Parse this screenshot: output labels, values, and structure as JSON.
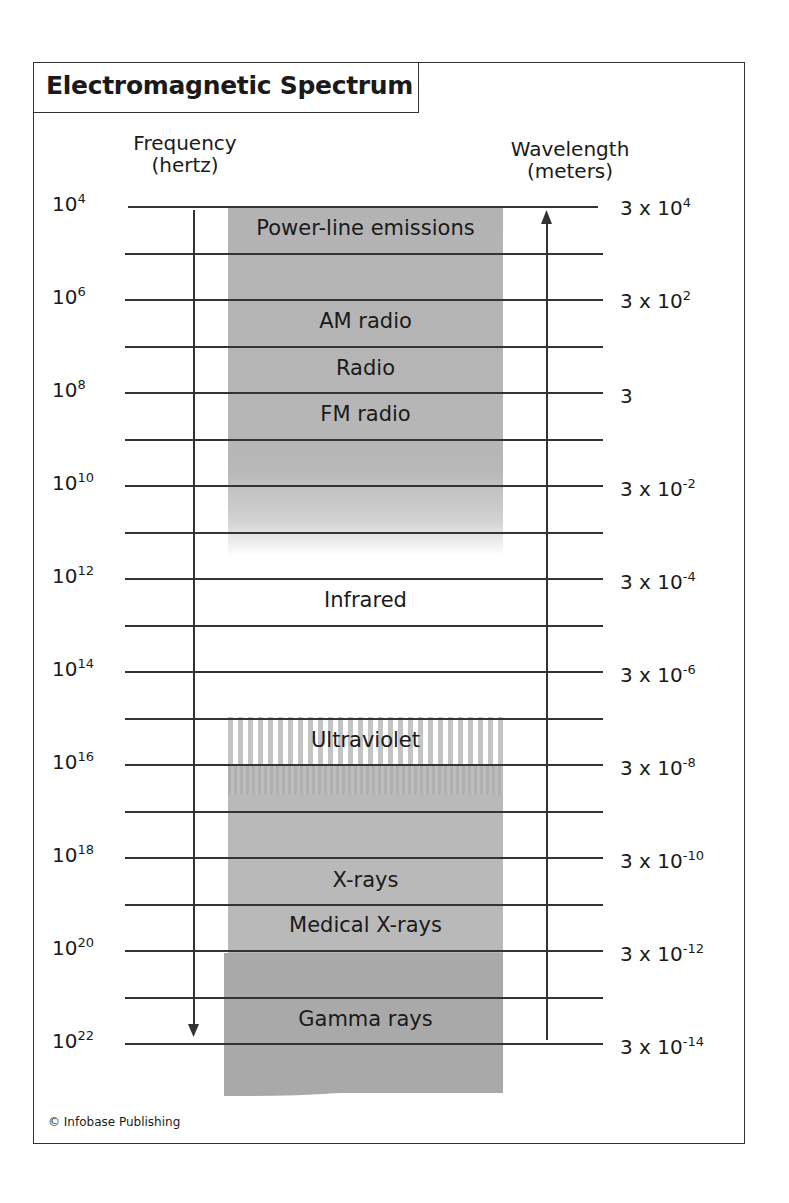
{
  "title": "Electromagnetic Spectrum",
  "axes": {
    "left": {
      "line1": "Frequency",
      "line2": "(hertz)"
    },
    "right": {
      "line1": "Wavelength",
      "line2": "(meters)"
    }
  },
  "frequency_ticks": [
    {
      "base": "10",
      "exp": "4"
    },
    {
      "base": "10",
      "exp": "6"
    },
    {
      "base": "10",
      "exp": "8"
    },
    {
      "base": "10",
      "exp": "10"
    },
    {
      "base": "10",
      "exp": "12"
    },
    {
      "base": "10",
      "exp": "14"
    },
    {
      "base": "10",
      "exp": "16"
    },
    {
      "base": "10",
      "exp": "18"
    },
    {
      "base": "10",
      "exp": "20"
    },
    {
      "base": "10",
      "exp": "22"
    }
  ],
  "wavelength_ticks": [
    {
      "base": "3 x 10",
      "exp": "4"
    },
    {
      "base": "3 x 10",
      "exp": "2"
    },
    {
      "base": "3",
      "exp": ""
    },
    {
      "base": "3 x 10",
      "exp": "-2"
    },
    {
      "base": "3 x 10",
      "exp": "-4"
    },
    {
      "base": "3 x 10",
      "exp": "-6"
    },
    {
      "base": "3 x 10",
      "exp": "-8"
    },
    {
      "base": "3 x 10",
      "exp": "-10"
    },
    {
      "base": "3 x 10",
      "exp": "-12"
    },
    {
      "base": "3 x 10",
      "exp": "-14"
    }
  ],
  "bands": [
    {
      "label": "Power-line emissions"
    },
    {
      "label": "AM radio"
    },
    {
      "label": "Radio"
    },
    {
      "label": "FM radio"
    },
    {
      "label": "Infrared"
    },
    {
      "label": "Ultraviolet"
    },
    {
      "label": "X-rays"
    },
    {
      "label": "Medical X-rays"
    },
    {
      "label": "Gamma rays"
    }
  ],
  "credit": "© Infobase Publishing",
  "colors": {
    "band_gray": "#b7b7b7",
    "band_dark": "#a9a9a9",
    "line": "#333333"
  }
}
